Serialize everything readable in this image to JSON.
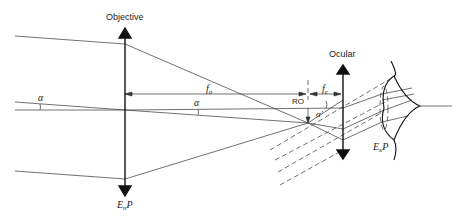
{
  "diagram": {
    "labels": {
      "objective": "Objective",
      "ocular": "Ocular",
      "entrance_pupil": "E",
      "entrance_pupil_sub": "n",
      "entrance_pupil_p": "P",
      "exit_pupil": "E",
      "exit_pupil_sub": "x",
      "exit_pupil_p": "P",
      "focal_objective": "f",
      "focal_objective_sub": "o",
      "focal_ocular": "f",
      "focal_ocular_sub": "e",
      "ro": "RO",
      "alpha_left": "α",
      "alpha_mid": "α",
      "alpha_prime": "α'"
    },
    "colors": {
      "line": "#333333",
      "background": "#ffffff"
    }
  }
}
